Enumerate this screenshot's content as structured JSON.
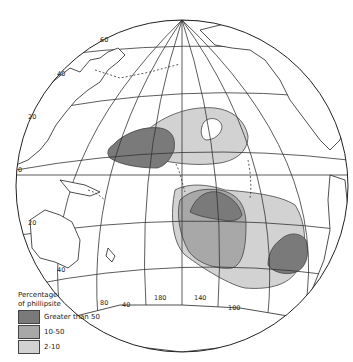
{
  "map": {
    "projection": "orthographic globe centered on the Pacific Ocean",
    "subject": "Distribution of phillipsite in Pacific deep-sea sediments",
    "latitude_labels": [
      "60",
      "40",
      "20",
      "0",
      "20",
      "40"
    ],
    "longitude_labels": [
      "80",
      "40",
      "180",
      "140",
      "100"
    ],
    "equator_label": "0",
    "regions": {
      "greater_than_50": [
        "north-central Pacific (west of Hawaii)",
        "south-central Pacific (east of Tuamotu)",
        "southeast Pacific"
      ],
      "ten_to_50": [
        "south-central Pacific band"
      ],
      "two_to_10": [
        "north-central Pacific",
        "southeast Pacific"
      ]
    }
  },
  "legend": {
    "title_line1": "Percentage",
    "title_line2": "of phillipsite",
    "items": [
      {
        "label": "Greater than 50",
        "color": "#7a7a7a"
      },
      {
        "label": "10-50",
        "color": "#a8a8a8"
      },
      {
        "label": "2-10",
        "color": "#d2d2d2"
      }
    ]
  },
  "colors": {
    "high": "#7a7a7a",
    "mid": "#a8a8a8",
    "low": "#d2d2d2",
    "line": "#222222"
  }
}
